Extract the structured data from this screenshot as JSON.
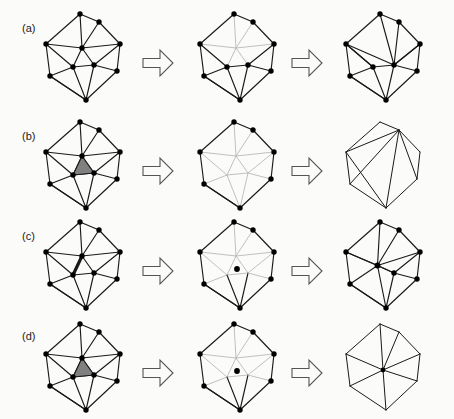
{
  "figure": {
    "caption_labels": [
      "(a)",
      "(b)",
      "(c)",
      "(d)"
    ],
    "background_color": "#fbfbfa",
    "stroke_color": "#1a1a1a",
    "faded_stroke_color": "#b9b9b9",
    "highlight_fill_color": "#808080",
    "vertex_color": "#000000",
    "arrow_stroke_color": "#555555",
    "width": 454,
    "height": 419
  },
  "rows": [
    {
      "id": "a",
      "label": "(a)",
      "operation": "vertex-removal",
      "label_x": 22,
      "label_y": 32,
      "stages": [
        {
          "name": "before",
          "x": 38,
          "y": 8,
          "kind": "full-mesh",
          "has_vertices": true
        },
        {
          "name": "during",
          "x": 192,
          "y": 8,
          "kind": "faded-star",
          "has_vertices": true
        },
        {
          "name": "after",
          "x": 338,
          "y": 8,
          "kind": "retriangulated",
          "has_vertices": true
        }
      ],
      "arrows": [
        {
          "x": 143,
          "y": 50
        },
        {
          "x": 292,
          "y": 50
        }
      ]
    },
    {
      "id": "b",
      "label": "(b)",
      "operation": "triangle-removal",
      "label_x": 22,
      "label_y": 140,
      "stages": [
        {
          "name": "before",
          "x": 38,
          "y": 116,
          "kind": "full-mesh-shaded-tri",
          "has_vertices": true
        },
        {
          "name": "during",
          "x": 192,
          "y": 116,
          "kind": "faded-hole",
          "has_vertices": true
        },
        {
          "name": "after",
          "x": 338,
          "y": 116,
          "kind": "hexagon-fan",
          "has_vertices": false
        }
      ],
      "arrows": [
        {
          "x": 143,
          "y": 158
        },
        {
          "x": 292,
          "y": 158
        }
      ]
    },
    {
      "id": "c",
      "label": "(c)",
      "operation": "edge-collapse",
      "label_x": 22,
      "label_y": 240,
      "stages": [
        {
          "name": "before",
          "x": 38,
          "y": 216,
          "kind": "full-mesh-bold-edge",
          "has_vertices": true
        },
        {
          "name": "during",
          "x": 192,
          "y": 216,
          "kind": "faded-with-dot",
          "has_vertices": true
        },
        {
          "name": "after",
          "x": 338,
          "y": 216,
          "kind": "collapsed-edge",
          "has_vertices": true
        }
      ],
      "arrows": [
        {
          "x": 143,
          "y": 258
        },
        {
          "x": 292,
          "y": 258
        }
      ]
    },
    {
      "id": "d",
      "label": "(d)",
      "operation": "triangle-collapse",
      "label_x": 22,
      "label_y": 340,
      "stages": [
        {
          "name": "before",
          "x": 38,
          "y": 318,
          "kind": "full-mesh-shaded-tri",
          "has_vertices": true
        },
        {
          "name": "during",
          "x": 192,
          "y": 318,
          "kind": "faded-with-dot",
          "has_vertices": true
        },
        {
          "name": "after",
          "x": 338,
          "y": 318,
          "kind": "vertex-fan",
          "has_vertices": false
        }
      ],
      "arrows": [
        {
          "x": 143,
          "y": 360
        },
        {
          "x": 292,
          "y": 360
        }
      ]
    }
  ],
  "mesh": {
    "note": "Local coordinates within a 100x100 stage box",
    "vertices": {
      "top": [
        42,
        6
      ],
      "topRight": [
        61,
        14
      ],
      "left": [
        8,
        36
      ],
      "center": [
        44,
        40
      ],
      "right": [
        82,
        36
      ],
      "midLeft": [
        35,
        59
      ],
      "midRight": [
        56,
        57
      ],
      "bottomLeft": [
        12,
        68
      ],
      "bottomRight": [
        79,
        63
      ],
      "bottom": [
        48,
        92
      ]
    },
    "boundary": [
      "top",
      "topRight",
      "right",
      "bottomRight",
      "bottom",
      "bottomLeft",
      "left"
    ],
    "interior": [
      "center",
      "midLeft",
      "midRight"
    ],
    "edges": [
      [
        "top",
        "topRight"
      ],
      [
        "topRight",
        "right"
      ],
      [
        "right",
        "bottomRight"
      ],
      [
        "bottomRight",
        "bottom"
      ],
      [
        "bottom",
        "bottomLeft"
      ],
      [
        "bottomLeft",
        "left"
      ],
      [
        "left",
        "top"
      ],
      [
        "top",
        "center"
      ],
      [
        "topRight",
        "center"
      ],
      [
        "right",
        "center"
      ],
      [
        "left",
        "center"
      ],
      [
        "center",
        "midLeft"
      ],
      [
        "center",
        "midRight"
      ],
      [
        "midLeft",
        "midRight"
      ],
      [
        "midLeft",
        "bottomLeft"
      ],
      [
        "midLeft",
        "bottom"
      ],
      [
        "midRight",
        "bottom"
      ],
      [
        "midRight",
        "bottomRight"
      ],
      [
        "left",
        "midLeft"
      ],
      [
        "bottomLeft",
        "bottom"
      ],
      [
        "midRight",
        "right"
      ]
    ],
    "star_edges_of_center": [
      [
        "top",
        "center"
      ],
      [
        "topRight",
        "center"
      ],
      [
        "right",
        "center"
      ],
      [
        "left",
        "center"
      ],
      [
        "center",
        "midLeft"
      ],
      [
        "center",
        "midRight"
      ]
    ],
    "shaded_triangle": [
      "center",
      "midLeft",
      "midRight"
    ],
    "bold_edge": [
      "center",
      "midLeft"
    ]
  }
}
